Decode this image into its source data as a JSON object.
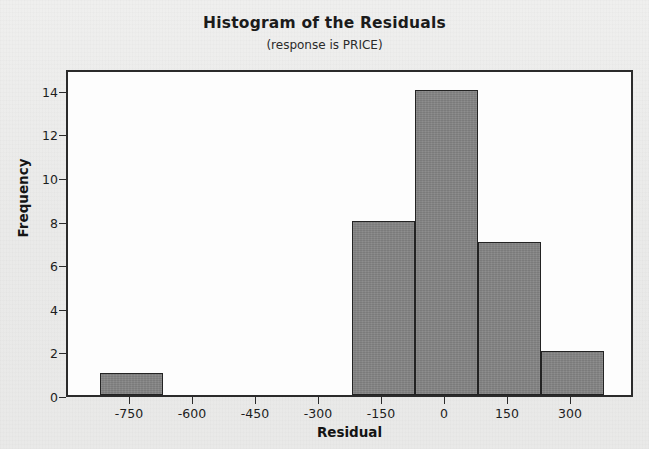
{
  "chart_data": {
    "type": "bar",
    "title": "Histogram of the Residuals",
    "subtitle": "(response is PRICE)",
    "xlabel": "Residual",
    "ylabel": "Frequency",
    "xlim": [
      -900,
      450
    ],
    "ylim": [
      0,
      15
    ],
    "grid": false,
    "legend": null,
    "bar_color": "#838383",
    "bar_edge_color": "#232323",
    "plot_background": "#fdfdfd",
    "figure_background": "#ececeb",
    "xticks": [
      -750,
      -600,
      -450,
      -300,
      -150,
      0,
      150,
      300
    ],
    "xtick_labels": [
      "-750",
      "-600",
      "-450",
      "-300",
      "-150",
      "0",
      "150",
      "300"
    ],
    "yticks": [
      0,
      2,
      4,
      6,
      8,
      10,
      12,
      14
    ],
    "ytick_labels": [
      "0",
      "2",
      "4",
      "6",
      "8",
      "10",
      "12",
      "14"
    ],
    "bin_width": 150,
    "bins": [
      {
        "left": -825,
        "right": -675,
        "center": -750,
        "frequency": 1
      },
      {
        "left": -225,
        "right": -75,
        "center": -150,
        "frequency": 8
      },
      {
        "left": -75,
        "right": 75,
        "center": 0,
        "frequency": 14
      },
      {
        "left": 75,
        "right": 225,
        "center": 150,
        "frequency": 7
      },
      {
        "left": 225,
        "right": 375,
        "center": 300,
        "frequency": 2
      }
    ],
    "categories": [
      "-750",
      "-150",
      "0",
      "150",
      "300"
    ],
    "values": [
      1,
      8,
      14,
      7,
      2
    ]
  }
}
